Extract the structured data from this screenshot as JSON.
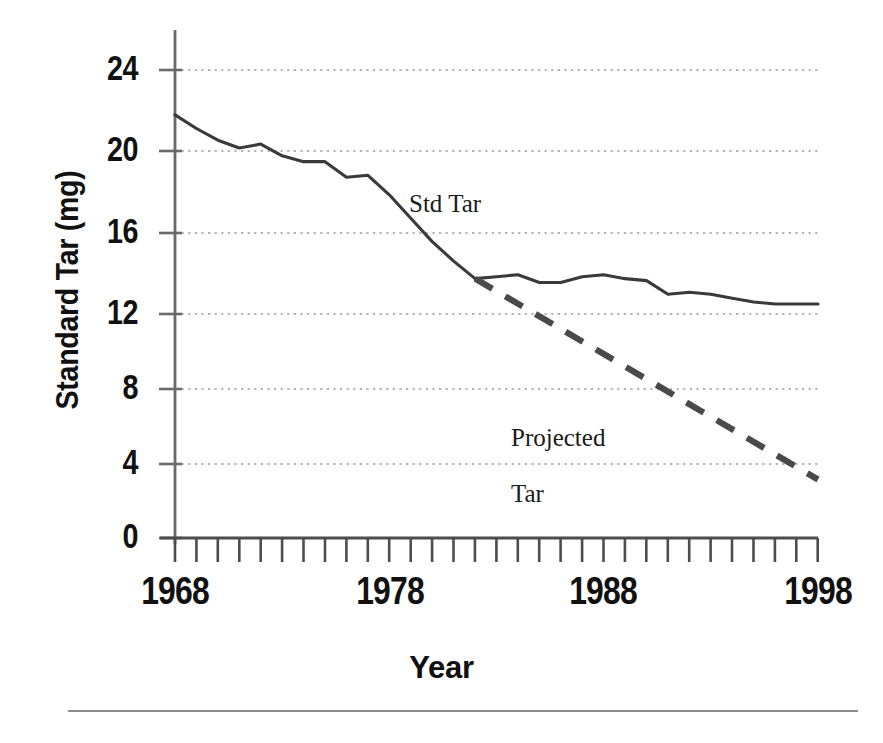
{
  "chart_data": {
    "type": "line",
    "title": "",
    "xlabel": "Year",
    "ylabel": "Standard Tar (mg)",
    "xlim": [
      1968,
      1998
    ],
    "ylim": [
      0,
      25.5
    ],
    "grid": true,
    "grid_style": "dotted horizontal",
    "legend_position": "inline-annotation",
    "y_ticks": [
      0,
      4,
      8,
      12,
      16,
      20,
      24
    ],
    "y_tick_labels": [
      "0",
      "4",
      "8",
      "12",
      "16",
      "20",
      "24"
    ],
    "x_ticks": [
      1968,
      1978,
      1988,
      1998
    ],
    "x_tick_labels": [
      "1968",
      "1978",
      "1988",
      "1998"
    ],
    "x_minor_tick_interval": 1,
    "x_minor_tick_count": 31,
    "series": [
      {
        "name": "Std Tar",
        "style": "solid",
        "color": "#3a3a3a",
        "x": [
          1968,
          1969,
          1970,
          1971,
          1972,
          1973,
          1974,
          1975,
          1976,
          1977,
          1978,
          1979,
          1980,
          1981,
          1982,
          1983,
          1984,
          1985,
          1986,
          1987,
          1988,
          1989,
          1990,
          1991,
          1992,
          1993,
          1994,
          1995,
          1996,
          1997,
          1998
        ],
        "values": [
          21.7,
          21.0,
          20.4,
          20.0,
          20.2,
          19.6,
          19.3,
          19.3,
          18.5,
          18.6,
          17.6,
          16.4,
          15.2,
          14.2,
          13.3,
          13.4,
          13.5,
          13.1,
          13.1,
          13.4,
          13.5,
          13.3,
          13.2,
          12.5,
          12.6,
          12.5,
          12.3,
          12.1,
          12.0,
          12.0,
          12.0
        ]
      },
      {
        "name": "Projected Tar",
        "style": "dashed",
        "color": "#4a4a4a",
        "x": [
          1982,
          1998
        ],
        "values": [
          13.3,
          3.0
        ]
      }
    ],
    "annotations": [
      {
        "text": "Std Tar",
        "x": 1978.5,
        "y": 16.9
      },
      {
        "text": "Projected\nTar",
        "x": 1985.0,
        "y": 7.3
      }
    ]
  },
  "axes": {
    "y_labels": [
      "24",
      "20",
      "16",
      "12",
      "8",
      "4",
      "0"
    ],
    "x_labels": [
      "1968",
      "1978",
      "1988",
      "1998"
    ],
    "y_title": "Standard Tar (mg)",
    "x_title": "Year"
  },
  "annotations": {
    "std_tar": "Std Tar",
    "projected_tar_line1": "Projected",
    "projected_tar_line2": "Tar"
  },
  "colors": {
    "series_solid": "#3a3a3a",
    "series_dashed": "#4a4a4a",
    "axis": "#6a6a6a",
    "grid": "#9a9a9a",
    "text": "#111111",
    "rule": "#8d8d8d",
    "background": "#ffffff"
  }
}
